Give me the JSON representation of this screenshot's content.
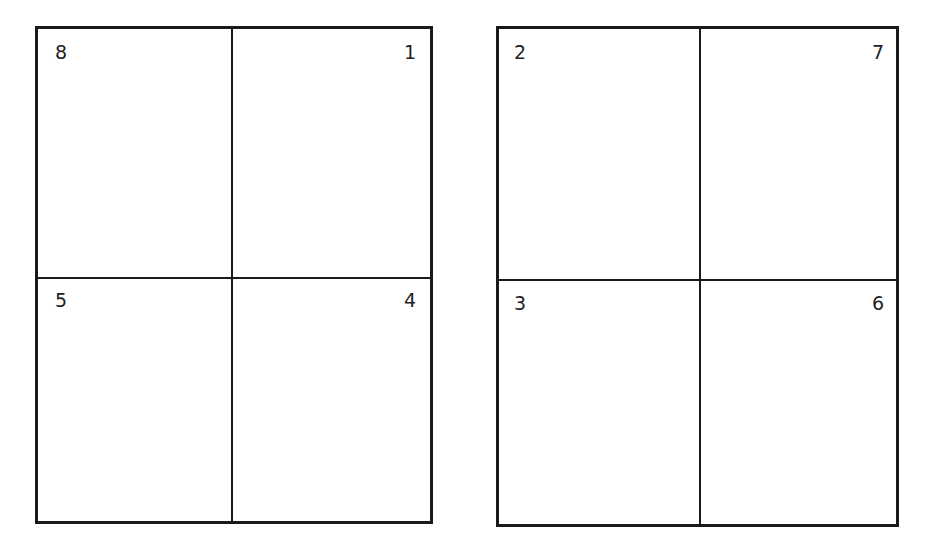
{
  "diagram": {
    "type": "imposition-layout",
    "sheets": [
      {
        "name": "left-sheet",
        "pages": [
          {
            "position": "top-left",
            "label": "8"
          },
          {
            "position": "top-right",
            "label": "1"
          },
          {
            "position": "bottom-left",
            "label": "5"
          },
          {
            "position": "bottom-right",
            "label": "4"
          }
        ]
      },
      {
        "name": "right-sheet",
        "pages": [
          {
            "position": "top-left",
            "label": "2"
          },
          {
            "position": "top-right",
            "label": "7"
          },
          {
            "position": "bottom-left",
            "label": "3"
          },
          {
            "position": "bottom-right",
            "label": "6"
          }
        ]
      }
    ],
    "colors": {
      "line": "#1a1a1a",
      "background": "#ffffff"
    }
  }
}
